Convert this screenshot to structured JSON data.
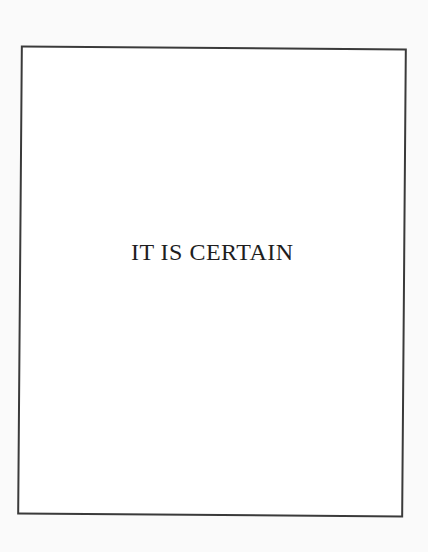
{
  "card": {
    "answer_text": "IT IS CERTAIN",
    "border_color": "#3a3a3a",
    "background_color": "#ffffff"
  },
  "page": {
    "background_color": "#fafafa"
  }
}
